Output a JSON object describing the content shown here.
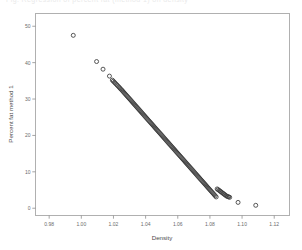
{
  "figure": {
    "top_caption": "Fig. Regression of percent fat (method 1) on density",
    "background_color": "#ffffff",
    "frame_color": "#b0b0b0",
    "marker_color": "#3a3a3a"
  },
  "chart_data": {
    "type": "scatter",
    "title": "",
    "xlabel": "Density",
    "ylabel": "Percent fat method 1",
    "xlim": [
      0.9715,
      1.1295
    ],
    "ylim": [
      -2.0,
      53.5
    ],
    "xticks": [
      0.98,
      1.0,
      1.02,
      1.04,
      1.06,
      1.08,
      1.1,
      1.12
    ],
    "xticklabels": [
      "0.98",
      "1.00",
      "1.02",
      "1.04",
      "1.06",
      "1.08",
      "1.10",
      "1.12"
    ],
    "yticks": [
      0,
      10,
      20,
      30,
      40,
      50
    ],
    "yticklabels": [
      "0",
      "10",
      "20",
      "30",
      "40",
      "50"
    ],
    "grid": false,
    "legend": null,
    "marker": "open-circle",
    "marker_size": 2.0,
    "x": [
      0.995,
      1.0095,
      1.0135,
      1.0175,
      1.0193,
      1.0199,
      1.0206,
      1.0212,
      1.0219,
      1.0225,
      1.0232,
      1.0238,
      1.0244,
      1.0251,
      1.0257,
      1.0263,
      1.0269,
      1.0275,
      1.0281,
      1.0287,
      1.0293,
      1.0299,
      1.0305,
      1.0311,
      1.0317,
      1.0323,
      1.0329,
      1.0335,
      1.0341,
      1.0347,
      1.0353,
      1.0359,
      1.0365,
      1.0371,
      1.0377,
      1.0383,
      1.0389,
      1.0395,
      1.0401,
      1.0407,
      1.0413,
      1.0419,
      1.0425,
      1.0431,
      1.0437,
      1.0443,
      1.0449,
      1.0455,
      1.0461,
      1.0467,
      1.0473,
      1.0479,
      1.0485,
      1.0491,
      1.0497,
      1.0503,
      1.0509,
      1.0515,
      1.0521,
      1.0527,
      1.0533,
      1.0539,
      1.0545,
      1.0551,
      1.0557,
      1.0563,
      1.0569,
      1.0575,
      1.0581,
      1.0587,
      1.0593,
      1.0599,
      1.0605,
      1.0611,
      1.0617,
      1.0623,
      1.0629,
      1.0635,
      1.0641,
      1.0647,
      1.0653,
      1.0659,
      1.0665,
      1.0671,
      1.0677,
      1.0683,
      1.0689,
      1.0695,
      1.0701,
      1.0707,
      1.0713,
      1.0719,
      1.0725,
      1.0731,
      1.0737,
      1.0743,
      1.0749,
      1.0755,
      1.0761,
      1.0767,
      1.0773,
      1.0779,
      1.0785,
      1.0791,
      1.0797,
      1.0803,
      1.0809,
      1.0815,
      1.0821,
      1.0827,
      1.0833,
      1.0839,
      1.0845,
      1.0851,
      1.0857,
      1.0863,
      1.0869,
      1.0875,
      1.0881,
      1.0887,
      1.0893,
      1.0899,
      1.0905,
      1.0911,
      1.0917,
      1.0923,
      1.0975,
      1.1085
    ],
    "y": [
      47.5,
      40.3,
      38.2,
      36.3,
      35.2,
      34.9,
      34.6,
      34.3,
      34.0,
      33.7,
      33.4,
      33.1,
      32.8,
      32.5,
      32.2,
      31.9,
      31.6,
      31.3,
      31.0,
      30.7,
      30.4,
      30.1,
      29.8,
      29.5,
      29.2,
      28.9,
      28.6,
      28.3,
      28.0,
      27.7,
      27.4,
      27.1,
      26.8,
      26.5,
      26.2,
      25.9,
      25.6,
      25.3,
      25.0,
      24.7,
      24.4,
      24.1,
      23.8,
      23.5,
      23.2,
      22.9,
      22.6,
      22.3,
      22.0,
      21.7,
      21.4,
      21.1,
      20.8,
      20.5,
      20.2,
      19.9,
      19.6,
      19.3,
      19.0,
      18.7,
      18.4,
      18.1,
      17.8,
      17.5,
      17.2,
      16.9,
      16.6,
      16.3,
      16.0,
      15.7,
      15.4,
      15.1,
      14.8,
      14.5,
      14.2,
      13.9,
      13.6,
      13.3,
      13.0,
      12.7,
      12.4,
      12.1,
      11.8,
      11.5,
      11.2,
      10.9,
      10.6,
      10.3,
      10.0,
      9.7,
      9.4,
      9.1,
      8.8,
      8.5,
      8.2,
      7.9,
      7.6,
      7.3,
      7.0,
      6.7,
      6.4,
      6.1,
      5.8,
      5.5,
      5.2,
      4.9,
      4.6,
      4.3,
      4.0,
      3.7,
      3.4,
      3.1,
      5.3,
      5.1,
      4.9,
      4.7,
      4.5,
      4.3,
      4.1,
      3.9,
      3.7,
      3.5,
      3.3,
      3.2,
      3.1,
      3.0,
      1.6,
      0.8
    ]
  }
}
